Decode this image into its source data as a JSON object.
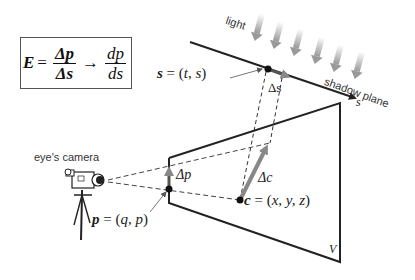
{
  "formula": {
    "lhs": "E",
    "equals": "=",
    "frac1_num": "Δp",
    "frac1_den": "Δs",
    "arrow": "→",
    "frac2_num": "dp",
    "frac2_den": "ds"
  },
  "labels": {
    "light": "light",
    "shadow_plane": "shadow plane",
    "eyes_camera": "eye's camera",
    "s_axis": "s",
    "V": "V",
    "delta_s": "Δs",
    "delta_p": "Δp",
    "delta_c": "Δc"
  },
  "points": {
    "s_point": {
      "name": "s",
      "eq": "= (",
      "coords": "t, s",
      "close": ")"
    },
    "p_point": {
      "name": "p",
      "eq": "= (",
      "coords": "q, p",
      "close": ")"
    },
    "c_point": {
      "name": "c",
      "eq": "= (",
      "coords": "x, y, z",
      "close": ")"
    }
  },
  "colors": {
    "line": "#222222",
    "arrow_gray": "#888888",
    "light_arrow": "#bbbbbb"
  }
}
